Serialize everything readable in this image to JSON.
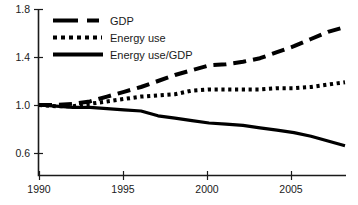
{
  "chart_data": {
    "type": "line",
    "title": "",
    "subtitle": "",
    "xlabel": "",
    "ylabel": "",
    "xlim": [
      1990,
      2008
    ],
    "ylim": [
      0.6,
      1.8
    ],
    "grid": false,
    "legend_position": "top-left",
    "xticks": [
      "1990",
      "1995",
      "2000",
      "2005"
    ],
    "xtick_values": [
      1990,
      1995,
      2000,
      2005
    ],
    "yticks": [
      "0.6",
      "1.0",
      "1.4",
      "1.8"
    ],
    "ytick_values": [
      0.6,
      1.0,
      1.4,
      1.8
    ],
    "x": [
      1990,
      1991,
      1992,
      1993,
      1994,
      1995,
      1996,
      1997,
      1998,
      1999,
      2000,
      2001,
      2002,
      2003,
      2004,
      2005,
      2006,
      2007,
      2008
    ],
    "series": [
      {
        "name": "GDP",
        "style": "long-dashed",
        "color": "#000000",
        "values": [
          1.0,
          1.0,
          1.01,
          1.03,
          1.07,
          1.11,
          1.15,
          1.2,
          1.25,
          1.29,
          1.33,
          1.34,
          1.36,
          1.39,
          1.44,
          1.49,
          1.55,
          1.61,
          1.65
        ]
      },
      {
        "name": "Energy use",
        "style": "dotted",
        "color": "#000000",
        "values": [
          1.0,
          0.99,
          0.99,
          1.01,
          1.03,
          1.05,
          1.07,
          1.08,
          1.09,
          1.12,
          1.13,
          1.13,
          1.13,
          1.13,
          1.14,
          1.14,
          1.15,
          1.17,
          1.19
        ]
      },
      {
        "name": "Energy use/GDP",
        "style": "solid",
        "color": "#000000",
        "values": [
          1.0,
          0.99,
          0.98,
          0.98,
          0.97,
          0.96,
          0.95,
          0.91,
          0.89,
          0.87,
          0.85,
          0.84,
          0.83,
          0.81,
          0.79,
          0.77,
          0.74,
          0.7,
          0.66
        ]
      }
    ]
  },
  "legend": {
    "items": [
      {
        "label": "GDP"
      },
      {
        "label": "Energy use"
      },
      {
        "label": "Energy use/GDP"
      }
    ]
  },
  "axes": {
    "y_labels": [
      "1.8",
      "1.4",
      "1.0",
      "0.6"
    ],
    "x_labels": [
      "1990",
      "1995",
      "2000",
      "2005"
    ]
  }
}
